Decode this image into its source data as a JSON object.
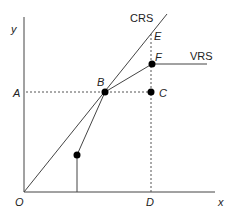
{
  "diagram": {
    "axes": {
      "x_label": "x",
      "y_label": "y",
      "origin_label": "O"
    },
    "frontiers": [
      {
        "name": "CRS",
        "label": "CRS"
      },
      {
        "name": "VRS",
        "label": "VRS"
      }
    ],
    "points": [
      {
        "id": "A",
        "label": "A",
        "marker": false
      },
      {
        "id": "B",
        "label": "B",
        "marker": true
      },
      {
        "id": "C",
        "label": "C",
        "marker": true
      },
      {
        "id": "D",
        "label": "D",
        "marker": false
      },
      {
        "id": "E",
        "label": "E",
        "marker": false
      },
      {
        "id": "F",
        "label": "F",
        "marker": true
      },
      {
        "id": "P1",
        "label": "",
        "marker": true
      }
    ],
    "colors": {
      "line": "#444444",
      "marker": "#000000",
      "text": "#222222"
    }
  }
}
